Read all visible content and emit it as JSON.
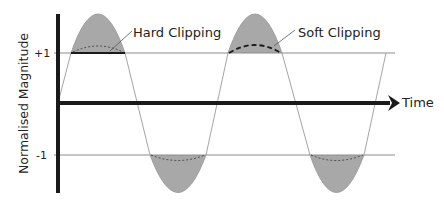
{
  "diagram": {
    "y_axis_label": "Normalised Magnitude",
    "x_axis_label": "Time",
    "ticks": {
      "plus_one": "+1",
      "minus_one": "-1"
    },
    "annotations": {
      "hard_clipping": "Hard Clipping",
      "soft_clipping": "Soft Clipping"
    },
    "colors": {
      "axis": "#1a1a1a",
      "fill": "#a8a8a8",
      "wave": "#8a8a8a",
      "threshold": "#8c8c8c"
    }
  }
}
